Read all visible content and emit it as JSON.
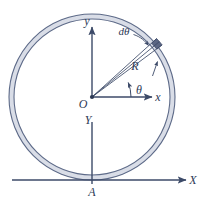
{
  "figure": {
    "background_color": "#ffffff",
    "line_color": "#3c4a68",
    "ring_fill_color": "#d8dce6",
    "element_fill_color": "#5b6683",
    "labels": {
      "origin": "O",
      "y_axis_upper": "y",
      "x_axis": "x",
      "Y_axis_lower": "Y",
      "X_axis_lower": "X",
      "radius": "R",
      "angle": "θ",
      "differential_angle": "dθ",
      "point_a": "A"
    },
    "icons": {
      "y_arrow": "arrow-up-icon",
      "x_arrow": "arrow-right-icon",
      "X_arrow": "arrow-right-icon",
      "theta_arc_arrow": "arc-arrow-icon",
      "dtheta_leader_arrow": "leader-arrow-icon",
      "element_pointer_arrow": "arrow-up-icon"
    },
    "geometry": {
      "center_x": 92,
      "center_y": 97,
      "outer_radius": 83,
      "inner_radius": 78,
      "element_angle_deg": 40,
      "element_width_deg": 7,
      "theta_deg": 22,
      "point_a_x": 92,
      "point_a_y": 180
    }
  }
}
